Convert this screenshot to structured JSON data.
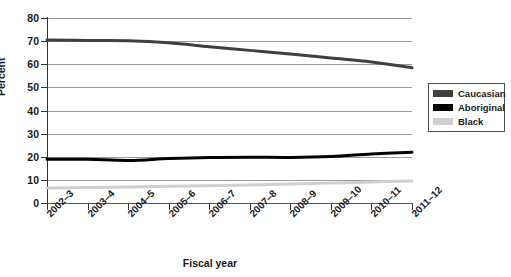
{
  "chart_data": {
    "type": "line",
    "title": "",
    "xlabel": "Fiscal year",
    "ylabel": "Percent",
    "ylim": [
      0,
      80
    ],
    "yticks": [
      0,
      10,
      20,
      30,
      40,
      50,
      60,
      70,
      80
    ],
    "grid": true,
    "legend_position": "right",
    "categories": [
      "2002–3",
      "2003–4",
      "2004–5",
      "2005–6",
      "2006–7",
      "2007–8",
      "2008–9",
      "2009–10",
      "2010–11",
      "2011–12"
    ],
    "series": [
      {
        "name": "Caucasian",
        "color": "#3f3f3f",
        "values": [
          70.5,
          70.3,
          70.2,
          69.3,
          67.6,
          66.0,
          64.4,
          62.7,
          61.0,
          58.5
        ]
      },
      {
        "name": "Aboriginal",
        "color": "#000000",
        "values": [
          18.9,
          18.9,
          18.4,
          19.2,
          19.7,
          19.8,
          19.7,
          20.1,
          21.2,
          22.0
        ]
      },
      {
        "name": "Black",
        "color": "#d0d0d0",
        "values": [
          6.5,
          6.7,
          6.9,
          7.2,
          7.5,
          7.8,
          8.2,
          8.6,
          9.1,
          9.5
        ]
      }
    ]
  },
  "legend": {
    "items": [
      {
        "label": "Caucasian",
        "color": "#3f3f3f"
      },
      {
        "label": "Aboriginal",
        "color": "#000000"
      },
      {
        "label": "Black",
        "color": "#d0d0d0"
      }
    ]
  },
  "axes": {
    "y_axis_title": "Percent",
    "x_axis_title": "Fiscal year"
  }
}
